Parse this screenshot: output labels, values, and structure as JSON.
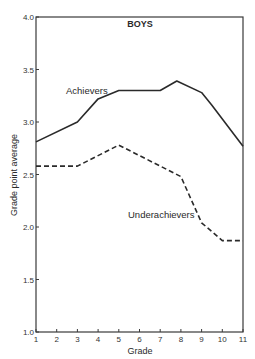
{
  "chart_data": {
    "type": "line",
    "title": "BOYS",
    "xlabel": "Grade",
    "ylabel": "Grade point average",
    "x": [
      1,
      2,
      3,
      4,
      5,
      6,
      7,
      8,
      9,
      10,
      11
    ],
    "x_ticks": [
      "1",
      "2",
      "3",
      "4",
      "5",
      "6",
      "7",
      "8",
      "9",
      "10",
      "11"
    ],
    "y_ticks": [
      "1.0",
      "1.5",
      "2.0",
      "2.5",
      "3.0",
      "3.5",
      "4.0"
    ],
    "xlim": [
      1,
      11
    ],
    "ylim": [
      1.0,
      4.0
    ],
    "grid": false,
    "legend": "inline labels",
    "series": [
      {
        "name": "Achievers",
        "style": "solid",
        "points": [
          [
            1,
            2.81
          ],
          [
            3,
            3.0
          ],
          [
            4,
            3.22
          ],
          [
            5,
            3.3
          ],
          [
            7,
            3.3
          ],
          [
            7.8,
            3.39
          ],
          [
            9,
            3.28
          ],
          [
            9.5,
            3.16
          ],
          [
            11,
            2.77
          ]
        ],
        "values": [
          2.81,
          2.9,
          3.0,
          3.22,
          3.3,
          3.3,
          3.3,
          3.38,
          3.28,
          3.14,
          2.77
        ]
      },
      {
        "name": "Underachievers",
        "style": "dashed",
        "points": [
          [
            1,
            2.58
          ],
          [
            3,
            2.58
          ],
          [
            5,
            2.78
          ],
          [
            8,
            2.48
          ],
          [
            9,
            2.04
          ],
          [
            10,
            1.87
          ],
          [
            11,
            1.87
          ]
        ],
        "values": [
          2.58,
          2.58,
          2.58,
          2.68,
          2.78,
          2.68,
          2.58,
          2.48,
          2.04,
          1.87,
          1.87
        ]
      }
    ],
    "annotations": [
      {
        "text": "Achievers",
        "near_series": "Achievers"
      },
      {
        "text": "Underachievers",
        "near_series": "Underachievers"
      }
    ]
  }
}
